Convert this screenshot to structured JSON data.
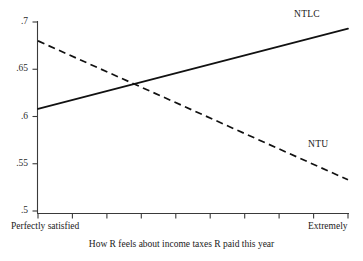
{
  "chart_data": {
    "type": "line",
    "title": "",
    "xlabel": "How R feels about income taxes R paid this year",
    "ylabel": "",
    "ylim": [
      0.5,
      0.7
    ],
    "xlim": [
      0,
      1
    ],
    "grid": false,
    "legend_position": "inline-right",
    "y_ticks": [
      ".5",
      ".55",
      ".6",
      ".65",
      ".7"
    ],
    "y_tick_values": [
      0.5,
      0.55,
      0.6,
      0.65,
      0.7
    ],
    "x_tick_count": 10,
    "x_axis_left_label": "Perfectly satisfied",
    "x_axis_right_label": "Extremely",
    "series": [
      {
        "name": "NTLC",
        "style": "solid",
        "color": "#111111",
        "x": [
          0,
          1
        ],
        "values": [
          0.608,
          0.693
        ],
        "label_x": 0.82,
        "label_y": 0.706
      },
      {
        "name": "NTU",
        "style": "dashed",
        "color": "#111111",
        "x": [
          0,
          1
        ],
        "values": [
          0.68,
          0.533
        ],
        "label_x": 0.875,
        "label_y": 0.573
      }
    ],
    "crossing_point": {
      "x": 0.38,
      "y": 0.637
    }
  },
  "axis": {
    "y_labels": [
      ".7",
      ".65",
      ".6",
      ".55",
      ".5"
    ],
    "x_left": "Perfectly satisfied",
    "x_right": "Extremely",
    "x_title": "How R feels about income taxes R paid this year"
  },
  "series_labels": {
    "ntlc": "NTLC",
    "ntu": "NTU"
  },
  "colors": {
    "line": "#111111",
    "axis": "#3a3a3a",
    "background": "#ffffff"
  }
}
